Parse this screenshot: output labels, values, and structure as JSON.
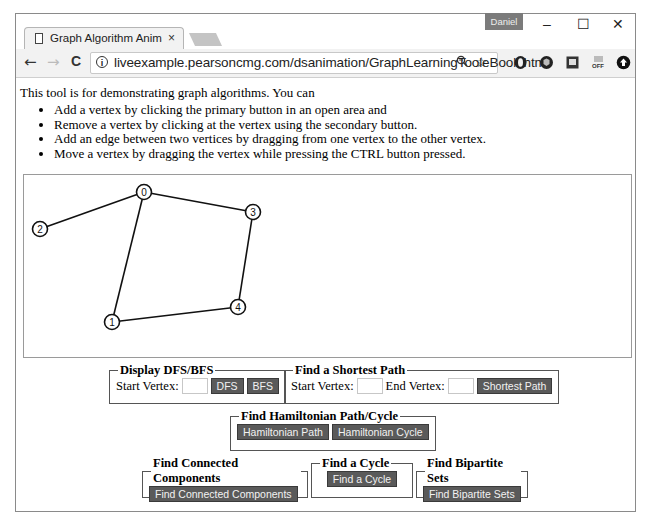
{
  "browser": {
    "tab_title": "Graph Algorithm Animat",
    "tab_close": "×",
    "user_badge": "Daniel",
    "window_controls": {
      "minimize": "–",
      "maximize": "☐",
      "close": "✕"
    },
    "nav": {
      "back": "←",
      "forward": "→",
      "reload": "C"
    },
    "url": "liveexample.pearsoncmg.com/dsanimation/GraphLearningTooleBook.html",
    "zoom_icon": "🔍",
    "star_icon": "☆",
    "extensions": [
      "opera-icon",
      "shield-icon",
      "note-icon",
      "off-icon",
      "upload-icon"
    ]
  },
  "page": {
    "intro": "This tool is for demonstrating graph algorithms. You can",
    "tips": [
      "Add a vertex by clicking the primary button in an open area and",
      "Remove a vertex by clicking at the vertex using the secondary button.",
      "Add an edge between two vertices by dragging from one vertex to the other vertex.",
      "Move a vertex by dragging the vertex while pressing the CTRL button pressed."
    ]
  },
  "graph": {
    "vertices": [
      {
        "id": "0",
        "x": 120,
        "y": 17
      },
      {
        "id": "1",
        "x": 88,
        "y": 147
      },
      {
        "id": "2",
        "x": 16,
        "y": 54
      },
      {
        "id": "3",
        "x": 229,
        "y": 37
      },
      {
        "id": "4",
        "x": 214,
        "y": 132
      }
    ],
    "edges": [
      [
        "0",
        "2"
      ],
      [
        "0",
        "3"
      ],
      [
        "0",
        "1"
      ],
      [
        "3",
        "4"
      ],
      [
        "1",
        "4"
      ]
    ]
  },
  "controls": {
    "dfs_bfs": {
      "legend": "Display DFS/BFS",
      "start_label": "Start Vertex:",
      "start_value": "",
      "dfs": "DFS",
      "bfs": "BFS"
    },
    "shortest": {
      "legend": "Find a Shortest Path",
      "start_label": "Start Vertex:",
      "start_value": "",
      "end_label": "End Vertex:",
      "end_value": "",
      "button": "Shortest Path"
    },
    "hamiltonian": {
      "legend": "Find Hamiltonian Path/Cycle",
      "path": "Hamiltonian Path",
      "cycle": "Hamiltonian Cycle"
    },
    "components": {
      "legend": "Find Connected Components",
      "button": "Find Connected Components"
    },
    "cycle": {
      "legend": "Find a Cycle",
      "button": "Find a Cycle"
    },
    "bipartite": {
      "legend": "Find Bipartite Sets",
      "button": "Find Bipartite Sets"
    }
  }
}
